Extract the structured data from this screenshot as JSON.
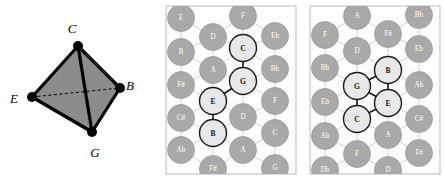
{
  "figure": {
    "panel_count": 3,
    "colors": {
      "node_off_fill": "#a9a9a9",
      "node_off_stroke": "#9a9a9a",
      "node_on_fill": "#e8e8e8",
      "node_on_stroke": "#1a1a1a",
      "lattice_line": "#cccccc",
      "highlight_edge": "#1a1a1a",
      "panel_bg": "#fdfdfd",
      "panel_border": "#b9b9b9",
      "tetra_face": "#8c8c8c",
      "tetra_edge": "#000000",
      "vertex_dot": "#000000"
    }
  },
  "tetrahedron": {
    "name": "tetrahedron-panel",
    "vertices": [
      {
        "id": "C",
        "label": "C",
        "x": 78,
        "y": 46,
        "label_x": 72,
        "label_y": 28
      },
      {
        "id": "B",
        "label": "B",
        "x": 120,
        "y": 88,
        "label_x": 130,
        "label_y": 85
      },
      {
        "id": "E",
        "label": "E",
        "x": 32,
        "y": 97,
        "label_x": 14,
        "label_y": 98
      },
      {
        "id": "G",
        "label": "G",
        "x": 92,
        "y": 132,
        "label_x": 95,
        "label_y": 152
      }
    ],
    "solid_edges": [
      [
        "C",
        "B"
      ],
      [
        "C",
        "E"
      ],
      [
        "C",
        "G"
      ],
      [
        "E",
        "G"
      ],
      [
        "B",
        "G"
      ]
    ],
    "dashed_edges": [
      [
        "E",
        "B"
      ]
    ],
    "shaded_faces": [
      [
        "C",
        "E",
        "G"
      ],
      [
        "C",
        "G",
        "B"
      ]
    ]
  },
  "lattice_panel_left": {
    "name": "tonnetz-panel-open",
    "frame": {
      "x": 166,
      "y": 6,
      "w": 130,
      "h": 168
    },
    "highlighted": [
      "C",
      "G",
      "E",
      "B"
    ],
    "highlight_edges": [
      [
        "C",
        "G"
      ],
      [
        "G",
        "E"
      ],
      [
        "E",
        "B"
      ]
    ],
    "nodes": [
      {
        "label": "E",
        "x": 181,
        "y": 18,
        "on": false
      },
      {
        "label": "F",
        "x": 243,
        "y": 16,
        "on": false
      },
      {
        "label": "D",
        "x": 213,
        "y": 37,
        "on": false
      },
      {
        "label": "Eb",
        "x": 275,
        "y": 36,
        "on": false
      },
      {
        "label": "B",
        "x": 181,
        "y": 52,
        "on": false
      },
      {
        "label": "C",
        "x": 243,
        "y": 48,
        "on": true
      },
      {
        "label": "A",
        "x": 213,
        "y": 70,
        "on": false
      },
      {
        "label": "Bb",
        "x": 275,
        "y": 69,
        "on": false
      },
      {
        "label": "F#",
        "x": 181,
        "y": 85,
        "on": false
      },
      {
        "label": "G",
        "x": 243,
        "y": 81,
        "on": true
      },
      {
        "label": "E",
        "x": 213,
        "y": 101,
        "on": true
      },
      {
        "label": "F",
        "x": 275,
        "y": 101,
        "on": false
      },
      {
        "label": "C#",
        "x": 181,
        "y": 118,
        "on": false
      },
      {
        "label": "D",
        "x": 243,
        "y": 117,
        "on": false
      },
      {
        "label": "B",
        "x": 213,
        "y": 133,
        "on": true
      },
      {
        "label": "C",
        "x": 275,
        "y": 133,
        "on": false
      },
      {
        "label": "Ab",
        "x": 181,
        "y": 150,
        "on": false
      },
      {
        "label": "A",
        "x": 243,
        "y": 150,
        "on": false
      },
      {
        "label": "F#",
        "x": 213,
        "y": 169,
        "on": false
      },
      {
        "label": "G",
        "x": 275,
        "y": 168,
        "on": false
      }
    ]
  },
  "lattice_panel_right": {
    "name": "tonnetz-panel-compact",
    "frame": {
      "x": 310,
      "y": 6,
      "w": 130,
      "h": 168
    },
    "highlighted": [
      "B",
      "G",
      "E",
      "C"
    ],
    "highlight_edges": [
      [
        "B",
        "G"
      ],
      [
        "B",
        "E"
      ],
      [
        "G",
        "E"
      ],
      [
        "G",
        "C"
      ],
      [
        "C",
        "E"
      ]
    ],
    "nodes": [
      {
        "label": "A",
        "x": 357,
        "y": 16,
        "on": false
      },
      {
        "label": "Bb",
        "x": 419,
        "y": 15,
        "on": false
      },
      {
        "label": "F",
        "x": 325,
        "y": 35,
        "on": false
      },
      {
        "label": "F#",
        "x": 388,
        "y": 34,
        "on": false
      },
      {
        "label": "D",
        "x": 357,
        "y": 51,
        "on": false
      },
      {
        "label": "Eb",
        "x": 419,
        "y": 49,
        "on": false
      },
      {
        "label": "Bb",
        "x": 325,
        "y": 68,
        "on": false
      },
      {
        "label": "B",
        "x": 388,
        "y": 70,
        "on": true
      },
      {
        "label": "G",
        "x": 357,
        "y": 86,
        "on": true
      },
      {
        "label": "Ab",
        "x": 419,
        "y": 85,
        "on": false
      },
      {
        "label": "Eb",
        "x": 325,
        "y": 102,
        "on": false
      },
      {
        "label": "E",
        "x": 388,
        "y": 103,
        "on": true
      },
      {
        "label": "C",
        "x": 357,
        "y": 119,
        "on": true
      },
      {
        "label": "C#",
        "x": 419,
        "y": 119,
        "on": false
      },
      {
        "label": "Ab",
        "x": 325,
        "y": 136,
        "on": false
      },
      {
        "label": "A",
        "x": 388,
        "y": 135,
        "on": false
      },
      {
        "label": "F",
        "x": 357,
        "y": 154,
        "on": false
      },
      {
        "label": "F#",
        "x": 419,
        "y": 153,
        "on": false
      },
      {
        "label": "Db",
        "x": 325,
        "y": 170,
        "on": false
      },
      {
        "label": "D",
        "x": 388,
        "y": 170,
        "on": false
      }
    ]
  }
}
